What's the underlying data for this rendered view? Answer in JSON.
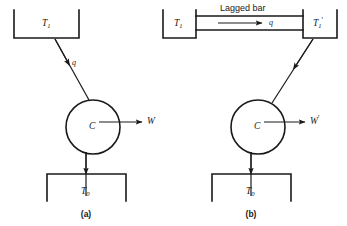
{
  "figure": {
    "background_color": "#ffffff",
    "line_color": "#1a1a1a"
  },
  "panel_a": {
    "caption": "(a)",
    "hot_reservoir_label": "T",
    "hot_reservoir_sub": "1",
    "engine_label": "C",
    "heat_label": "q",
    "work_label": "W",
    "cold_reservoir_label": "T",
    "cold_reservoir_sub": "0"
  },
  "panel_b": {
    "caption": "(b)",
    "hot_reservoir_label": "T",
    "hot_reservoir_sub": "1",
    "second_reservoir_label": "T",
    "second_reservoir_sub": "1",
    "second_reservoir_prime": "'",
    "bar_label": "Lagged bar",
    "bar_heat_label": "q",
    "engine_label": "C",
    "work_label": "W",
    "work_prime": "'",
    "cold_reservoir_label": "T",
    "cold_reservoir_sub": "0"
  }
}
